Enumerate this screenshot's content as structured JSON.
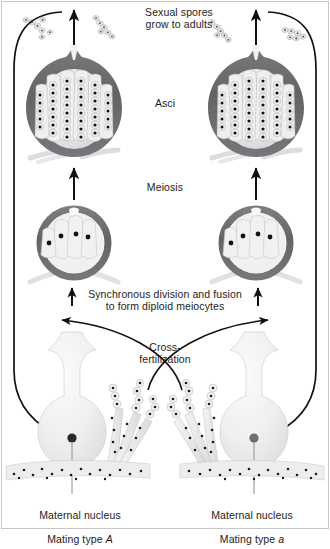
{
  "figure": {
    "width": 330,
    "height": 530,
    "background": "#ffffff"
  },
  "labels": {
    "sexual_spores": "Sexual spores\ngrow to adults",
    "asci": "Asci",
    "meiosis": "Meiosis",
    "synchronous": "Synchronous division and fusion\nto form diploid meiocytes",
    "cross_fertilization": "Cross-\nfertilization",
    "maternal_left_line1": "Maternal nucleus",
    "maternal_left_line2_prefix": "Mating type ",
    "maternal_left_line2_type": "A",
    "maternal_right_line1": "Maternal nucleus",
    "maternal_right_line2_prefix": "Mating type ",
    "maternal_right_line2_type": "a"
  },
  "colors": {
    "ink": "#1c1c1c",
    "perithecium_wall": "#6f7072",
    "perithecium_wall_dark": "#58595b",
    "interior_fill": "#e2e3e4",
    "ascus_fill": "#eceded",
    "spore_outline": "#9a9b9d",
    "nucleus_dark": "#141414",
    "nucleus_gray": "#6d6e70",
    "cell_body": "#eeefef",
    "cell_body_edge": "#c9cacb",
    "hypha_fill": "#e9eaea",
    "arrow": "#111111",
    "frame": "#bdbec0"
  },
  "structures": {
    "asci_stage": {
      "name": "Asci (mature perithecia)",
      "count": 2,
      "spore_columns": 6,
      "spores_per_column": 9
    },
    "meiocyte_stage": {
      "name": "Young perithecia with diploid meiocytes",
      "count": 2,
      "cells_per_structure": 4,
      "nuclei_per_cell": 1
    },
    "adult_stage": {
      "name": "Maternal cells with conidiophores",
      "count": 2,
      "mating_types": [
        "A",
        "a"
      ]
    },
    "released_spores": {
      "name": "Sexual spores growing to adults",
      "count": 4
    }
  },
  "arrows": {
    "meiosis_up": 2,
    "synchronous_up": 2,
    "cross_fertilization": 2,
    "cycle_return": 2
  }
}
